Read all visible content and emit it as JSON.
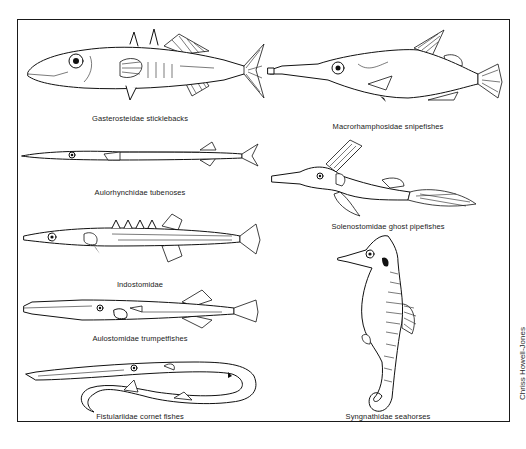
{
  "figure": {
    "title": "",
    "style": "black-and-white line drawings of fish",
    "panels": [
      {
        "id": "gasterosteidae",
        "label": "Gasterosteidae sticklebacks",
        "column": "left",
        "row": 1
      },
      {
        "id": "aulorhynchidae",
        "label": "Aulorhynchidae tubenoses",
        "column": "left",
        "row": 2
      },
      {
        "id": "indostomidae",
        "label": "Indostomidae",
        "column": "left",
        "row": 3
      },
      {
        "id": "aulostomidae",
        "label": "Aulostomidae trumpetfishes",
        "column": "left",
        "row": 4
      },
      {
        "id": "fistulariidae",
        "label": "Fistulariidae cornet fishes",
        "column": "left",
        "row": 5
      },
      {
        "id": "macrorhamphosidae",
        "label": "Macrorhamphosidae snipefishes",
        "column": "right",
        "row": 1
      },
      {
        "id": "solenostomidae",
        "label": "Solenostomidae ghost pipefishes",
        "column": "right",
        "row": 2
      },
      {
        "id": "syngnathidae",
        "label": "Syngnathidae seahorses",
        "column": "right",
        "row": 3
      }
    ],
    "credit": "Chriss Howell-Jones"
  }
}
